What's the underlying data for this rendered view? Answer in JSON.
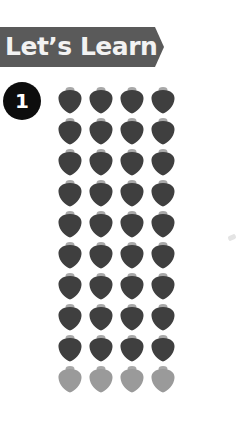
{
  "header": {
    "title": "Let’s Learn",
    "banner_color": "#5a5a5a"
  },
  "exercise": {
    "number": "1"
  },
  "counting_grid": {
    "item_icon": "strawberry-icon",
    "columns": 4,
    "rows": [
      {
        "shade": "dark",
        "count": 4
      },
      {
        "shade": "dark",
        "count": 4
      },
      {
        "shade": "dark",
        "count": 4
      },
      {
        "shade": "dark",
        "count": 4
      },
      {
        "shade": "dark",
        "count": 4
      },
      {
        "shade": "dark",
        "count": 4
      },
      {
        "shade": "dark",
        "count": 4
      },
      {
        "shade": "dark",
        "count": 4
      },
      {
        "shade": "dark",
        "count": 4
      },
      {
        "shade": "light",
        "count": 4
      }
    ],
    "colors": {
      "dark": "#3f3f3f",
      "light": "#9a9a9a",
      "cap": "#a8a8a8"
    }
  }
}
